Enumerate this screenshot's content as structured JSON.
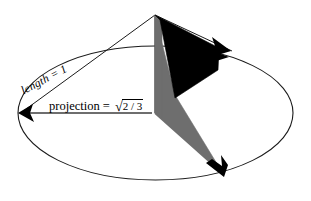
{
  "figure": {
    "background_color": "#ffffff",
    "width": 311,
    "height": 201,
    "labels": {
      "length": "length = 1",
      "projection_prefix": "projection = ",
      "radical_sign": "√",
      "radicand": "2 / 3"
    },
    "colors": {
      "outline": "#1a1a1a",
      "black_fill": "#000000",
      "gray_fill": "#6e6e6e",
      "projection_line": "#6e6e6e",
      "background": "#ffffff"
    },
    "geometry": {
      "apex": [
        155,
        15
      ],
      "ellipse_center": [
        155.5,
        113
      ],
      "ellipse_rx": 137.5,
      "ellipse_ry": 67,
      "arrow_left_tip": [
        19,
        113
      ],
      "arrow_right_tip": [
        224,
        50
      ],
      "arrow_bottom_tip": [
        222,
        176
      ]
    }
  }
}
